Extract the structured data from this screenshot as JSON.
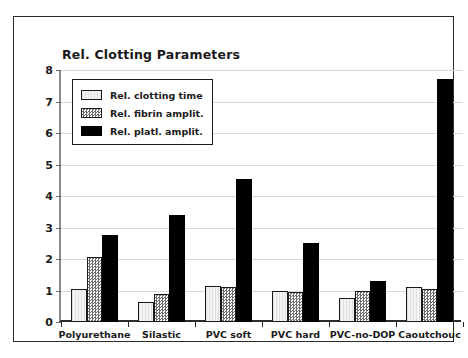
{
  "chart_data": {
    "type": "bar",
    "title": "Rel. Clotting Parameters",
    "xlabel": "",
    "ylabel": "",
    "ylim": [
      0,
      8
    ],
    "yticks": [
      0,
      1,
      2,
      3,
      4,
      5,
      6,
      7,
      8
    ],
    "grid": true,
    "legend_position": "upper-left-inside",
    "categories": [
      "Polyurethane",
      "Silastic",
      "PVC soft",
      "PVC hard",
      "PVC-no-DOP",
      "Caoutchouc"
    ],
    "series": [
      {
        "name": "Rel. clotting time",
        "fill": "light-stipple",
        "color": "#f4f4f4",
        "values": [
          1.05,
          0.62,
          1.15,
          1.0,
          0.75,
          1.1
        ]
      },
      {
        "name": "Rel. fibrin amplit.",
        "fill": "checker-gray",
        "color": "#6e6e6e",
        "values": [
          2.05,
          0.9,
          1.1,
          0.95,
          1.0,
          1.05
        ]
      },
      {
        "name": "Rel. platl. amplit.",
        "fill": "solid-black",
        "color": "#000000",
        "values": [
          2.75,
          3.4,
          4.55,
          2.5,
          1.3,
          7.7
        ]
      }
    ]
  },
  "colors": {
    "axis": "#2b2b2b",
    "grid": "#d8d8d8",
    "text": "#1a1a1a",
    "background": "#ffffff"
  }
}
